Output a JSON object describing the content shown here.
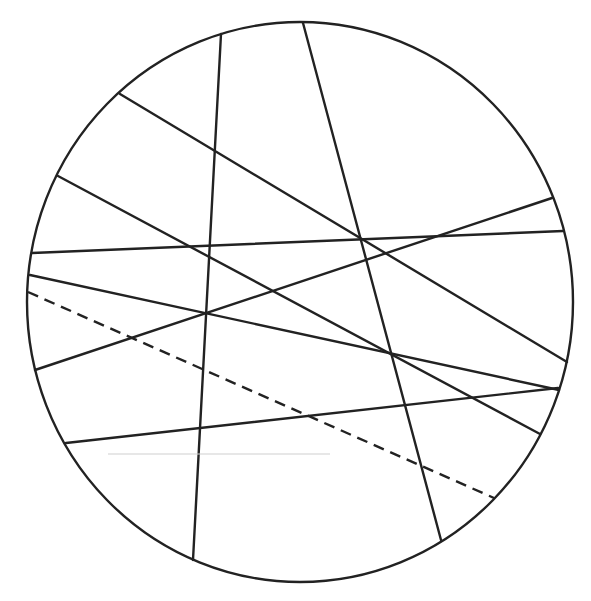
{
  "diagram": {
    "type": "circle-with-chords",
    "canvas": {
      "width": 591,
      "height": 601,
      "background": "#ffffff"
    },
    "circle": {
      "cx": 300,
      "cy": 302,
      "rx": 273,
      "ry": 280,
      "stroke": "#222222"
    },
    "chords": [
      {
        "id": "chord-1",
        "x1": 221,
        "y1": 34,
        "x2": 193,
        "y2": 560,
        "style": "solid"
      },
      {
        "id": "chord-2",
        "x1": 303,
        "y1": 23,
        "x2": 441,
        "y2": 540,
        "style": "solid"
      },
      {
        "id": "chord-3",
        "x1": 120,
        "y1": 94,
        "x2": 567,
        "y2": 362,
        "style": "solid"
      },
      {
        "id": "chord-4",
        "x1": 58,
        "y1": 176,
        "x2": 540,
        "y2": 434,
        "style": "solid"
      },
      {
        "id": "chord-5",
        "x1": 32,
        "y1": 253,
        "x2": 563,
        "y2": 231,
        "style": "solid"
      },
      {
        "id": "chord-6",
        "x1": 30,
        "y1": 275,
        "x2": 559,
        "y2": 390,
        "style": "solid"
      },
      {
        "id": "chord-7",
        "x1": 35,
        "y1": 370,
        "x2": 552,
        "y2": 198,
        "style": "solid"
      },
      {
        "id": "chord-8",
        "x1": 66,
        "y1": 443,
        "x2": 558,
        "y2": 388,
        "style": "solid"
      }
    ],
    "dashed_line": {
      "id": "dashed-chord",
      "x1": 28,
      "y1": 292,
      "x2": 494,
      "y2": 498,
      "style": "dashed"
    },
    "guide_line": {
      "id": "gray-guide",
      "x1": 108,
      "y1": 454,
      "x2": 330,
      "y2": 454,
      "color": "#cfcfcf"
    }
  }
}
